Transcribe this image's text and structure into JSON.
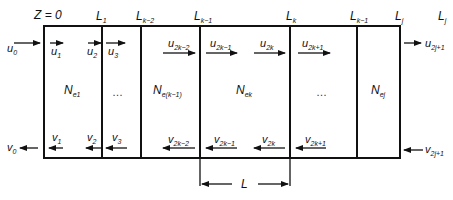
{
  "diagram": {
    "stroke_color": "#111111",
    "top_labels": [
      {
        "id": "z0",
        "main": "Z = 0",
        "sub": ""
      },
      {
        "id": "L1",
        "main": "L",
        "sub": "1"
      },
      {
        "id": "Lk2",
        "main": "L",
        "sub": "k−2"
      },
      {
        "id": "Lk1",
        "main": "L",
        "sub": "k−1"
      },
      {
        "id": "Lk",
        "main": "L",
        "sub": "k"
      },
      {
        "id": "Lk1b",
        "main": "L",
        "sub": "k−1"
      },
      {
        "id": "Lj",
        "main": "L",
        "sub": "j"
      },
      {
        "id": "Lj2",
        "main": "L",
        "sub": "j"
      }
    ],
    "forward_waves": [
      {
        "main": "u",
        "sub": "0"
      },
      {
        "main": "u",
        "sub": "1"
      },
      {
        "main": "u",
        "sub": "2"
      },
      {
        "main": "u",
        "sub": "3"
      },
      {
        "main": "u",
        "sub": "2k−2"
      },
      {
        "main": "u",
        "sub": "2k−1"
      },
      {
        "main": "u",
        "sub": "2k"
      },
      {
        "main": "u",
        "sub": "2k+1"
      },
      {
        "main": "u",
        "sub": "2j+1"
      }
    ],
    "backward_waves": [
      {
        "main": "v",
        "sub": "0"
      },
      {
        "main": "v",
        "sub": "1"
      },
      {
        "main": "v",
        "sub": "2"
      },
      {
        "main": "v",
        "sub": "3"
      },
      {
        "main": "v",
        "sub": "2k−2"
      },
      {
        "main": "v",
        "sub": "2k−1"
      },
      {
        "main": "v",
        "sub": "2k"
      },
      {
        "main": "v",
        "sub": "2k+1"
      },
      {
        "main": "v",
        "sub": "2j+1"
      }
    ],
    "segments": [
      {
        "main": "N",
        "sub": "e1"
      },
      {
        "main": "…",
        "sub": ""
      },
      {
        "main": "N",
        "sub": "e(k−1)"
      },
      {
        "main": "N",
        "sub": "ek"
      },
      {
        "main": "…",
        "sub": ""
      },
      {
        "main": "N",
        "sub": "ej"
      }
    ],
    "dimension": {
      "label": "L"
    }
  }
}
